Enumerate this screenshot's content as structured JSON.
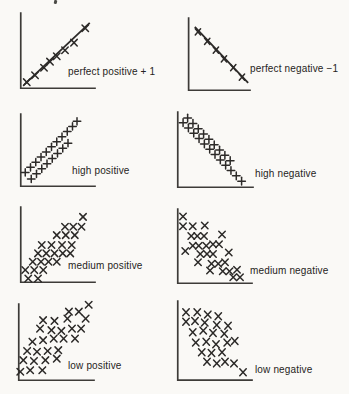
{
  "page": {
    "colors": {
      "paper": "#faf9f6",
      "ink": "#2c2a28",
      "axis": "#3d3b38"
    }
  },
  "chart_data": [
    {
      "id": "perfect-positive",
      "type": "scatter",
      "label": "perfect positive + 1",
      "correlation": "+1",
      "marker": "x",
      "frame": {
        "left": 20,
        "top": 13,
        "width": 75,
        "height": 76
      },
      "label_pos": {
        "left": 68,
        "top": 67
      },
      "trend_line": {
        "x1": 5,
        "y1": 5,
        "x2": 93,
        "y2": 87
      },
      "points": [
        [
          9,
          9
        ],
        [
          20,
          18
        ],
        [
          32,
          28
        ],
        [
          40,
          36
        ],
        [
          49,
          43
        ],
        [
          60,
          51
        ],
        [
          72,
          61
        ],
        [
          87,
          80
        ]
      ]
    },
    {
      "id": "perfect-negative",
      "type": "scatter",
      "label": "perfect negative −1",
      "correlation": "-1",
      "marker": "x",
      "frame": {
        "left": 188,
        "top": 18,
        "width": 62,
        "height": 73
      },
      "label_pos": {
        "left": 250,
        "top": 64
      },
      "trend_line": {
        "x1": 11,
        "y1": 88,
        "x2": 97,
        "y2": 11
      },
      "points": [
        [
          16,
          81
        ],
        [
          31,
          68
        ],
        [
          45,
          56
        ],
        [
          58,
          44
        ],
        [
          73,
          32
        ],
        [
          87,
          19
        ]
      ]
    },
    {
      "id": "high-positive",
      "type": "scatter",
      "label": "high positive",
      "correlation": "high +",
      "marker": "plus",
      "frame": {
        "left": 20,
        "top": 114,
        "width": 75,
        "height": 73
      },
      "label_pos": {
        "left": 72,
        "top": 166
      },
      "trend_line": null,
      "points": [
        [
          7,
          20
        ],
        [
          14,
          27
        ],
        [
          21,
          34
        ],
        [
          28,
          41
        ],
        [
          35,
          48
        ],
        [
          42,
          55
        ],
        [
          49,
          62
        ],
        [
          56,
          69
        ],
        [
          63,
          76
        ],
        [
          70,
          83
        ],
        [
          76,
          90
        ],
        [
          15,
          11
        ],
        [
          22,
          18
        ],
        [
          29,
          25
        ],
        [
          36,
          32
        ],
        [
          43,
          39
        ],
        [
          50,
          46
        ],
        [
          57,
          53
        ],
        [
          64,
          60
        ]
      ]
    },
    {
      "id": "high-negative",
      "type": "scatter",
      "label": "high negative",
      "correlation": "high −",
      "marker": "plus",
      "frame": {
        "left": 177,
        "top": 112,
        "width": 76,
        "height": 76
      },
      "label_pos": {
        "left": 255,
        "top": 169
      },
      "trend_line": null,
      "points": [
        [
          8,
          86
        ],
        [
          15,
          79
        ],
        [
          22,
          72
        ],
        [
          29,
          65
        ],
        [
          36,
          58
        ],
        [
          43,
          51
        ],
        [
          50,
          44
        ],
        [
          57,
          37
        ],
        [
          64,
          30
        ],
        [
          71,
          23
        ],
        [
          78,
          16
        ],
        [
          85,
          9
        ],
        [
          14,
          92
        ],
        [
          21,
          85
        ],
        [
          28,
          78
        ],
        [
          35,
          71
        ],
        [
          42,
          64
        ],
        [
          49,
          57
        ],
        [
          56,
          50
        ],
        [
          63,
          43
        ],
        [
          70,
          36
        ]
      ]
    },
    {
      "id": "medium-positive",
      "type": "scatter",
      "label": "medium positive",
      "correlation": "medium +",
      "marker": "x",
      "frame": {
        "left": 20,
        "top": 207,
        "width": 75,
        "height": 76
      },
      "label_pos": {
        "left": 68,
        "top": 261
      },
      "trend_line": null,
      "points": [
        [
          84,
          87
        ],
        [
          60,
          74
        ],
        [
          71,
          74
        ],
        [
          82,
          74
        ],
        [
          49,
          63
        ],
        [
          61,
          63
        ],
        [
          73,
          63
        ],
        [
          29,
          50
        ],
        [
          42,
          50
        ],
        [
          56,
          50
        ],
        [
          69,
          50
        ],
        [
          24,
          39
        ],
        [
          35,
          39
        ],
        [
          46,
          39
        ],
        [
          57,
          39
        ],
        [
          67,
          39
        ],
        [
          17,
          28
        ],
        [
          28,
          28
        ],
        [
          38,
          28
        ],
        [
          49,
          28
        ],
        [
          7,
          17
        ],
        [
          19,
          17
        ],
        [
          31,
          17
        ],
        [
          11,
          6
        ],
        [
          24,
          6
        ]
      ]
    },
    {
      "id": "medium-negative",
      "type": "scatter",
      "label": "medium negative",
      "correlation": "medium −",
      "marker": "x",
      "frame": {
        "left": 177,
        "top": 209,
        "width": 75,
        "height": 75
      },
      "label_pos": {
        "left": 250,
        "top": 266
      },
      "trend_line": null,
      "points": [
        [
          8,
          90
        ],
        [
          8,
          77
        ],
        [
          21,
          77
        ],
        [
          37,
          78
        ],
        [
          19,
          64
        ],
        [
          27,
          64
        ],
        [
          36,
          64
        ],
        [
          60,
          66
        ],
        [
          21,
          51
        ],
        [
          29,
          51
        ],
        [
          39,
          51
        ],
        [
          48,
          53
        ],
        [
          56,
          53
        ],
        [
          11,
          44
        ],
        [
          31,
          40
        ],
        [
          40,
          40
        ],
        [
          48,
          40
        ],
        [
          69,
          42
        ],
        [
          28,
          29
        ],
        [
          46,
          27
        ],
        [
          55,
          27
        ],
        [
          64,
          29
        ],
        [
          44,
          18
        ],
        [
          61,
          17
        ],
        [
          70,
          17
        ],
        [
          80,
          19
        ],
        [
          75,
          9
        ],
        [
          84,
          9
        ]
      ]
    },
    {
      "id": "low-positive",
      "type": "scatter",
      "label": "low positive",
      "correlation": "low +",
      "marker": "x",
      "frame": {
        "left": 18,
        "top": 304,
        "width": 76,
        "height": 77
      },
      "label_pos": {
        "left": 68,
        "top": 361
      },
      "trend_line": null,
      "points": [
        [
          93,
          99
        ],
        [
          67,
          90
        ],
        [
          80,
          90
        ],
        [
          33,
          79
        ],
        [
          48,
          78
        ],
        [
          65,
          81
        ],
        [
          89,
          81
        ],
        [
          29,
          68
        ],
        [
          44,
          66
        ],
        [
          57,
          65
        ],
        [
          71,
          68
        ],
        [
          83,
          68
        ],
        [
          19,
          51
        ],
        [
          33,
          53
        ],
        [
          47,
          55
        ],
        [
          60,
          55
        ],
        [
          75,
          55
        ],
        [
          12,
          39
        ],
        [
          25,
          38
        ],
        [
          39,
          39
        ],
        [
          53,
          40
        ],
        [
          7,
          27
        ],
        [
          21,
          26
        ],
        [
          36,
          27
        ],
        [
          51,
          29
        ],
        [
          3,
          12
        ],
        [
          16,
          14
        ],
        [
          32,
          14
        ]
      ]
    },
    {
      "id": "low-negative",
      "type": "scatter",
      "label": "low negative",
      "correlation": "low −",
      "marker": "x",
      "frame": {
        "left": 177,
        "top": 301,
        "width": 75,
        "height": 80
      },
      "label_pos": {
        "left": 255,
        "top": 365
      },
      "trend_line": null,
      "points": [
        [
          12,
          86
        ],
        [
          27,
          86
        ],
        [
          41,
          83
        ],
        [
          55,
          81
        ],
        [
          12,
          74
        ],
        [
          24,
          75
        ],
        [
          37,
          73
        ],
        [
          53,
          70
        ],
        [
          68,
          69
        ],
        [
          21,
          61
        ],
        [
          35,
          63
        ],
        [
          48,
          60
        ],
        [
          63,
          59
        ],
        [
          25,
          48
        ],
        [
          39,
          49
        ],
        [
          52,
          46
        ],
        [
          67,
          48
        ],
        [
          77,
          50
        ],
        [
          33,
          36
        ],
        [
          46,
          35
        ],
        [
          60,
          36
        ],
        [
          40,
          24
        ],
        [
          53,
          22
        ],
        [
          64,
          24
        ],
        [
          76,
          22
        ],
        [
          88,
          11
        ]
      ]
    }
  ]
}
